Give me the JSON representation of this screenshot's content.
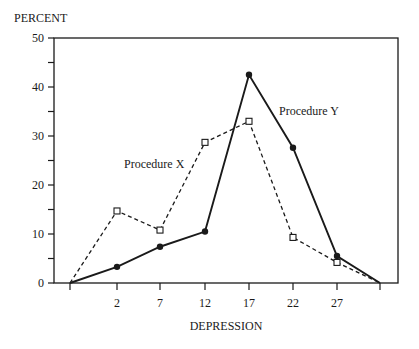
{
  "chart_data": {
    "type": "line",
    "title": "",
    "xlabel": "DEPRESSION",
    "ylabel": "PERCENT",
    "x": [
      "",
      "2",
      "7",
      "12",
      "17",
      "22",
      "27",
      ""
    ],
    "ylim": [
      0,
      50
    ],
    "yticks": [
      0,
      10,
      20,
      30,
      40,
      50
    ],
    "grid": false,
    "legend": "inline annotations",
    "series": [
      {
        "name": "Procedure X",
        "style": "dashed",
        "marker": "open-square",
        "values": [
          0,
          14.7,
          10.8,
          28.7,
          33.0,
          9.3,
          4.2,
          0
        ]
      },
      {
        "name": "Procedure Y",
        "style": "solid",
        "marker": "filled-circle",
        "values": [
          0,
          3.3,
          7.4,
          10.5,
          42.5,
          27.6,
          5.5,
          0
        ]
      }
    ],
    "annotations": [
      "Procedure X",
      "Procedure Y"
    ]
  },
  "labels": {
    "ylabel": "PERCENT",
    "xlabel": "DEPRESSION",
    "series_x": "Procedure X",
    "series_y": "Procedure Y"
  },
  "colors": {
    "ink": "#1a1a1a",
    "background": "#ffffff"
  }
}
